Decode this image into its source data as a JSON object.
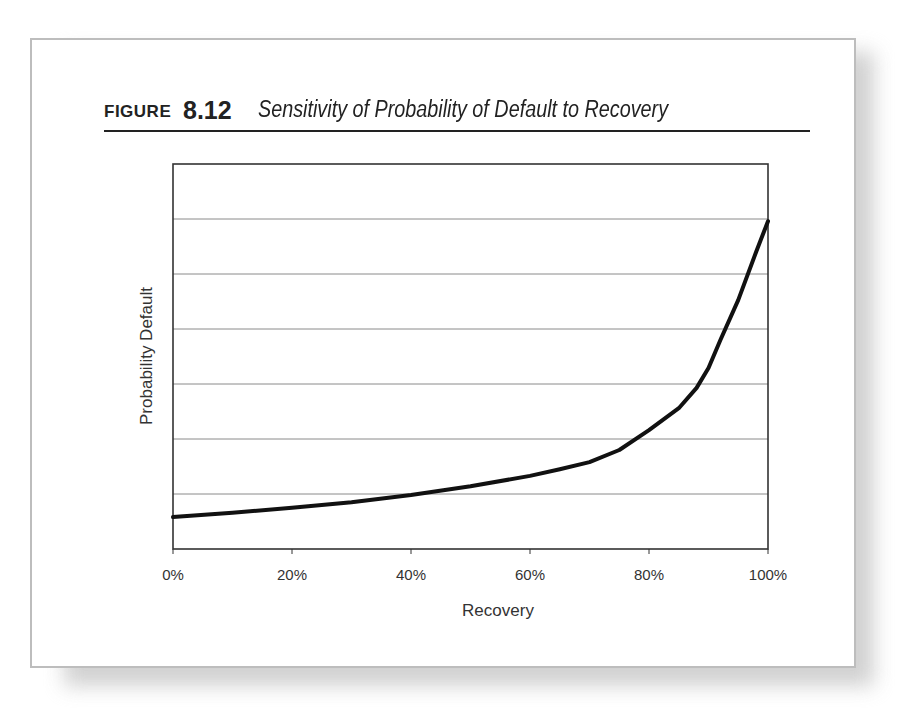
{
  "figure": {
    "label_word": "FIGURE",
    "label_number": "8.12",
    "title": "Sensitivity of Probability of Default to Recovery"
  },
  "chart_data": {
    "type": "line",
    "title": "Sensitivity of Probability of Default to Recovery",
    "xlabel": "Recovery",
    "ylabel": "Probability Default",
    "x_tick_labels": [
      "0%",
      "20%",
      "40%",
      "60%",
      "80%",
      "100%"
    ],
    "y_tick_labels": [],
    "xlim": [
      0,
      100
    ],
    "ylim": [
      0,
      7
    ],
    "y_units_note": "relative units; y axis unlabeled, 7 gridline bands",
    "grid": {
      "horizontal": true,
      "vertical": false,
      "gridlines": 6
    },
    "legend": null,
    "series": [
      {
        "name": "Probability Default",
        "x": [
          0,
          10,
          20,
          30,
          40,
          50,
          60,
          65,
          70,
          75,
          80,
          85,
          88,
          90,
          92,
          95,
          98,
          100
        ],
        "values": [
          0.58,
          0.66,
          0.75,
          0.85,
          0.98,
          1.14,
          1.33,
          1.45,
          1.58,
          1.8,
          2.16,
          2.56,
          2.93,
          3.29,
          3.8,
          4.53,
          5.4,
          5.96
        ]
      }
    ]
  }
}
